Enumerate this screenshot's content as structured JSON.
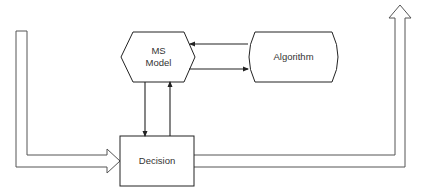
{
  "diagram": {
    "nodes": {
      "ms_model": {
        "line1": "MS",
        "line2": "Model",
        "shape": "hexagon"
      },
      "algorithm": {
        "label": "Algorithm",
        "shape": "rounded-sides"
      },
      "decision": {
        "label": "Decision",
        "shape": "rectangle"
      }
    },
    "edges": [
      {
        "from": "algorithm",
        "to": "ms_model",
        "type": "arrow"
      },
      {
        "from": "ms_model",
        "to": "algorithm",
        "type": "arrow"
      },
      {
        "from": "ms_model",
        "to": "decision",
        "type": "arrow"
      },
      {
        "from": "decision",
        "to": "ms_model",
        "type": "arrow"
      },
      {
        "from": "input",
        "to": "decision",
        "type": "hollow-band-arrow"
      },
      {
        "from": "decision",
        "to": "output",
        "type": "hollow-band-arrow"
      }
    ],
    "colors": {
      "stroke": "#222222",
      "band": "#555555",
      "background": "#ffffff"
    }
  }
}
